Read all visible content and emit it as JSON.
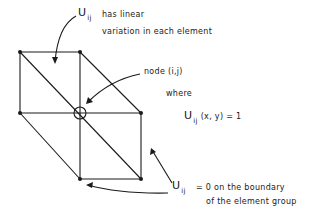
{
  "diagram": {
    "colors": {
      "line": "#1a1a1a",
      "background": "#ffffff"
    },
    "nodes": [
      {
        "id": "top-left",
        "x": 20,
        "y": 52
      },
      {
        "id": "top-middle",
        "x": 80,
        "y": 52
      },
      {
        "id": "left-middle",
        "x": 20,
        "y": 113
      },
      {
        "id": "center",
        "x": 80,
        "y": 113
      },
      {
        "id": "right-middle",
        "x": 141,
        "y": 113
      },
      {
        "id": "bottom-middle",
        "x": 80,
        "y": 179
      },
      {
        "id": "bottom-right",
        "x": 141,
        "y": 179
      }
    ],
    "labels": {
      "top": {
        "symbol": "U",
        "subscript": "ij",
        "line1": "has linear",
        "line2": "variation in each element"
      },
      "node": {
        "text": "node (i,j)",
        "where": "where",
        "eq_symbol": "U",
        "eq_subscript": "ij",
        "eq_rest": "(x, y) = 1"
      },
      "bottom": {
        "symbol": "U",
        "subscript": "ij",
        "line1": "= 0 on the boundary",
        "line2": "of the element group"
      }
    }
  }
}
